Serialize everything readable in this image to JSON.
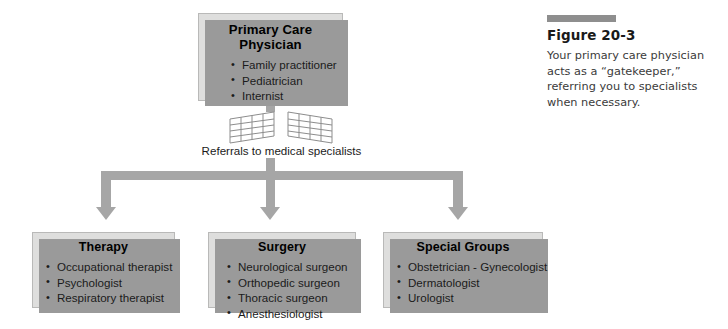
{
  "figure": {
    "bar_color": "#8e8e8e",
    "title": "Figure 20-3",
    "caption": "Your primary care physician acts as a “gatekeeper,” referring you to specialists when necessary."
  },
  "diagram": {
    "box_fill": "#dededd",
    "shadow_color": "#9a9a9a",
    "connector_color": "#a6a6a6",
    "top_node": {
      "title": "Primary Care Physician",
      "items": [
        "Family practitioner",
        "Pediatrician",
        "Internist"
      ]
    },
    "gate": {
      "icon": "open-gate-icon",
      "label": "Referrals to medical specialists"
    },
    "branches": [
      {
        "title": "Therapy",
        "items": [
          "Occupational therapist",
          "Psychologist",
          "Respiratory therapist"
        ]
      },
      {
        "title": "Surgery",
        "items": [
          "Neurological surgeon",
          "Orthopedic surgeon",
          "Thoracic surgeon",
          "Anesthesiologist"
        ]
      },
      {
        "title": "Special Groups",
        "items": [
          "Obstetrician - Gynecologist",
          "Dermatologist",
          "Urologist"
        ]
      }
    ]
  }
}
